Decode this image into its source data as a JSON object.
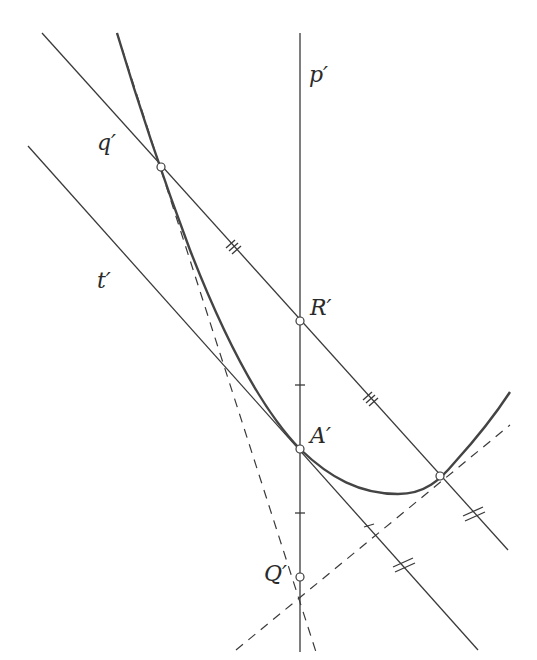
{
  "diagram": {
    "type": "geometric-construction",
    "labels": {
      "p": "p′",
      "q": "q′",
      "t": "t′",
      "R": "R′",
      "A": "A′",
      "Q": "Q′"
    },
    "points": [
      {
        "name": "R′",
        "x": 300,
        "y": 321
      },
      {
        "name": "A′",
        "x": 300,
        "y": 449
      },
      {
        "name": "Q′",
        "x": 300,
        "y": 577
      },
      {
        "name": "intersection-left",
        "x": 161,
        "y": 167
      },
      {
        "name": "intersection-right",
        "x": 440,
        "y": 476
      }
    ],
    "lines": [
      {
        "name": "p′",
        "style": "solid",
        "from": [
          300,
          33
        ],
        "to": [
          300,
          652
        ]
      },
      {
        "name": "q′",
        "style": "solid",
        "from": [
          42,
          33
        ],
        "to": [
          508,
          550
        ]
      },
      {
        "name": "t′",
        "style": "solid",
        "from": [
          28,
          146
        ],
        "to": [
          478,
          650
        ]
      },
      {
        "name": "tangent-left",
        "style": "dashed",
        "from": [
          117,
          33
        ],
        "to": [
          316,
          652
        ]
      },
      {
        "name": "tangent-right",
        "style": "dashed",
        "from": [
          236,
          650
        ],
        "to": [
          510,
          425
        ]
      }
    ],
    "colors": {
      "line": "#3a3a3a",
      "curve": "#444444",
      "background": "#ffffff"
    }
  }
}
